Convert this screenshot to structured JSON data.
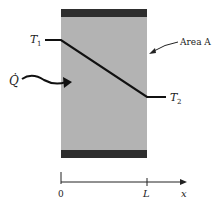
{
  "diagram": {
    "labels": {
      "t1": "T",
      "t1_sub": "1",
      "t2": "T",
      "t2_sub": "2",
      "area": "Area A",
      "heat_flow": "Q̇",
      "x_origin": "0",
      "x_L": "L",
      "x_axis": "x"
    },
    "colors": {
      "slab": "#b3b3b3",
      "slab_edge": "#2e2e2e",
      "line": "#111111"
    }
  }
}
